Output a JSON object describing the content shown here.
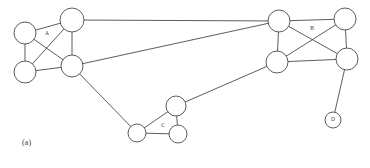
{
  "figure": {
    "caption": "(a)",
    "caption_x": 22,
    "caption_y": 138,
    "width": 370,
    "height": 168,
    "background_color": "#ffffff",
    "stroke_color": "#4a4a4a",
    "node_fill_color": "#ffffff",
    "label_color": "#3a3a3a"
  },
  "graph_data": {
    "type": "node-link-graph",
    "description": "Undirected network graph with four labeled groups: dense cluster A at left, dense cluster B at right, triangular cluster C at bottom center, and single node D at bottom right.",
    "nodes": [
      {
        "id": "a1",
        "cluster": "A",
        "x": 25,
        "y": 33,
        "r": 11
      },
      {
        "id": "a2",
        "cluster": "A",
        "x": 72,
        "y": 20,
        "r": 12
      },
      {
        "id": "a3",
        "cluster": "A",
        "x": 25,
        "y": 72,
        "r": 11
      },
      {
        "id": "a4",
        "cluster": "A",
        "x": 72,
        "y": 66,
        "r": 11
      },
      {
        "id": "b1",
        "cluster": "B",
        "x": 279,
        "y": 21,
        "r": 11
      },
      {
        "id": "b2",
        "cluster": "B",
        "x": 345,
        "y": 19,
        "r": 11
      },
      {
        "id": "b3",
        "cluster": "B",
        "x": 277,
        "y": 62,
        "r": 11
      },
      {
        "id": "b4",
        "cluster": "B",
        "x": 347,
        "y": 59,
        "r": 11
      },
      {
        "id": "c1",
        "cluster": "C",
        "x": 176,
        "y": 106,
        "r": 10
      },
      {
        "id": "c2",
        "cluster": "C",
        "x": 137,
        "y": 133,
        "r": 9
      },
      {
        "id": "c3",
        "cluster": "C",
        "x": 178,
        "y": 134,
        "r": 9
      },
      {
        "id": "d1",
        "cluster": "D",
        "x": 333,
        "y": 120,
        "r": 8
      }
    ],
    "edges": [
      {
        "source": "a1",
        "target": "a2",
        "kind": "intra-cluster"
      },
      {
        "source": "a1",
        "target": "a3",
        "kind": "intra-cluster"
      },
      {
        "source": "a1",
        "target": "a4",
        "kind": "intra-cluster"
      },
      {
        "source": "a2",
        "target": "a3",
        "kind": "intra-cluster"
      },
      {
        "source": "a2",
        "target": "a4",
        "kind": "intra-cluster"
      },
      {
        "source": "a3",
        "target": "a4",
        "kind": "intra-cluster"
      },
      {
        "source": "b1",
        "target": "b2",
        "kind": "intra-cluster"
      },
      {
        "source": "b1",
        "target": "b3",
        "kind": "intra-cluster"
      },
      {
        "source": "b1",
        "target": "b4",
        "kind": "intra-cluster"
      },
      {
        "source": "b2",
        "target": "b3",
        "kind": "intra-cluster"
      },
      {
        "source": "b2",
        "target": "b4",
        "kind": "intra-cluster"
      },
      {
        "source": "b3",
        "target": "b4",
        "kind": "intra-cluster"
      },
      {
        "source": "c1",
        "target": "c2",
        "kind": "intra-cluster"
      },
      {
        "source": "c1",
        "target": "c3",
        "kind": "intra-cluster"
      },
      {
        "source": "c2",
        "target": "c3",
        "kind": "intra-cluster"
      },
      {
        "source": "a2",
        "target": "b1",
        "kind": "inter-cluster"
      },
      {
        "source": "a4",
        "target": "b1",
        "kind": "inter-cluster"
      },
      {
        "source": "a4",
        "target": "c2",
        "kind": "inter-cluster"
      },
      {
        "source": "c1",
        "target": "b3",
        "kind": "inter-cluster"
      },
      {
        "source": "d1",
        "target": "b4",
        "kind": "inter-cluster"
      }
    ],
    "cluster_labels": [
      {
        "id": "A",
        "text": "A",
        "x": 47,
        "y": 34
      },
      {
        "id": "B",
        "text": "B",
        "x": 312,
        "y": 29
      },
      {
        "id": "C",
        "text": "C",
        "x": 163,
        "y": 126
      }
    ],
    "node_labels": [
      {
        "id": "D",
        "text": "D",
        "node": "d1",
        "x": 333,
        "y": 120
      }
    ]
  }
}
